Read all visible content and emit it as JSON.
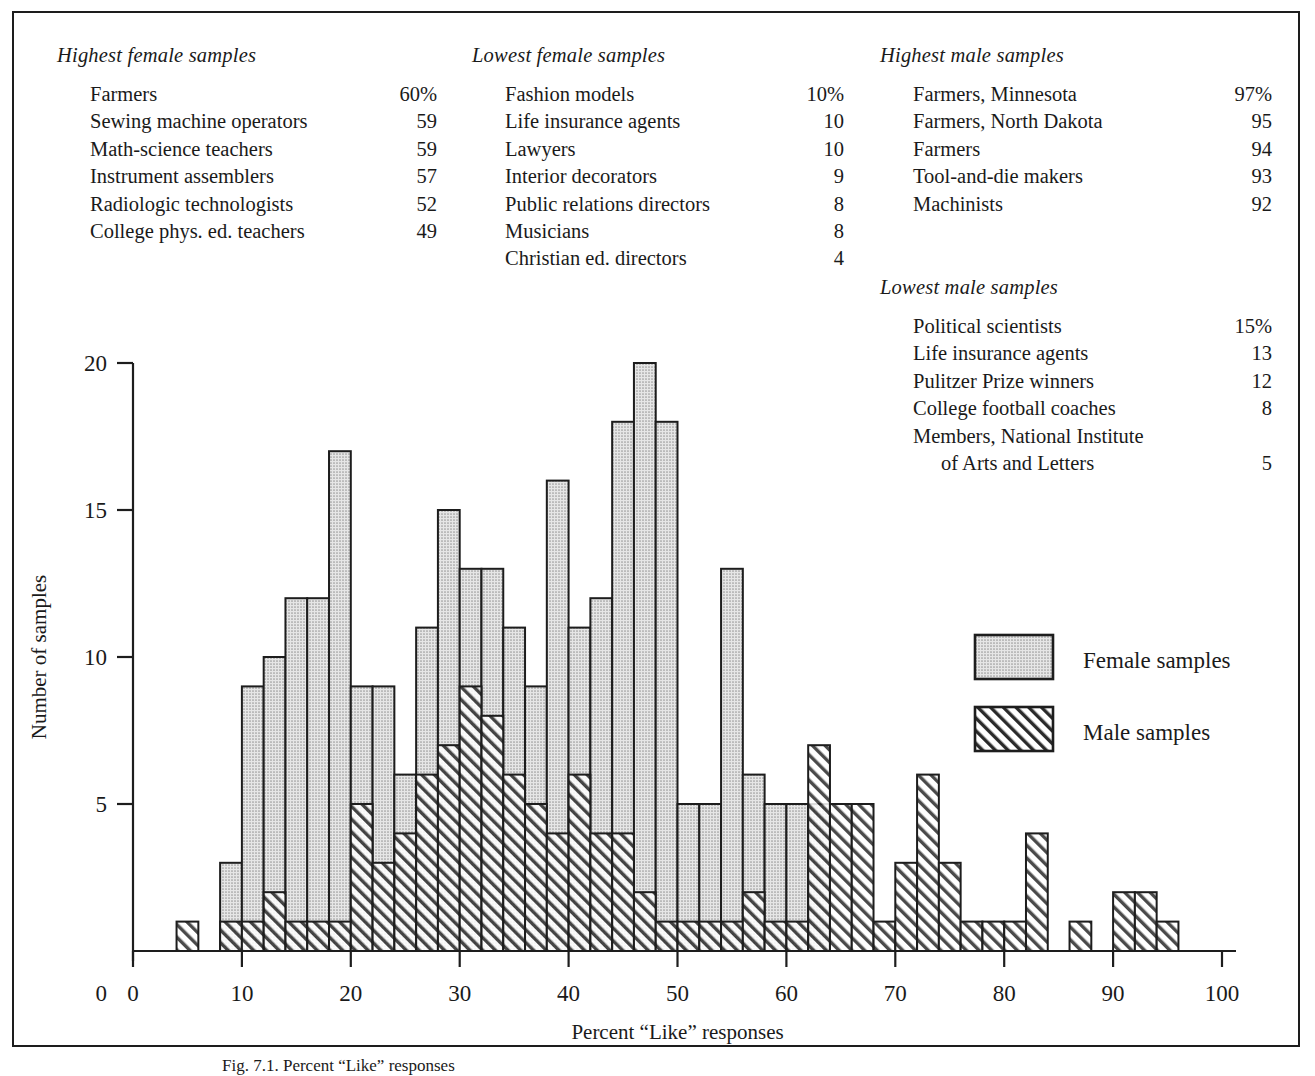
{
  "tables": [
    {
      "id": "highest-female",
      "title": "Highest female samples",
      "rows": [
        {
          "label": "Farmers",
          "value": "60%"
        },
        {
          "label": "Sewing machine operators",
          "value": "59"
        },
        {
          "label": "Math-science teachers",
          "value": "59"
        },
        {
          "label": "Instrument assemblers",
          "value": "57"
        },
        {
          "label": "Radiologic technologists",
          "value": "52"
        },
        {
          "label": "College phys. ed. teachers",
          "value": "49"
        }
      ]
    },
    {
      "id": "lowest-female",
      "title": "Lowest female samples",
      "rows": [
        {
          "label": "Fashion models",
          "value": "10%"
        },
        {
          "label": "Life insurance agents",
          "value": "10"
        },
        {
          "label": "Lawyers",
          "value": "10"
        },
        {
          "label": "Interior decorators",
          "value": "9"
        },
        {
          "label": "Public relations directors",
          "value": "8"
        },
        {
          "label": "Musicians",
          "value": "8"
        },
        {
          "label": "Christian ed. directors",
          "value": "4"
        }
      ]
    },
    {
      "id": "highest-male",
      "title": "Highest male samples",
      "rows": [
        {
          "label": "Farmers, Minnesota",
          "value": "97%"
        },
        {
          "label": "Farmers, North Dakota",
          "value": "95"
        },
        {
          "label": "Farmers",
          "value": "94"
        },
        {
          "label": "Tool-and-die makers",
          "value": "93"
        },
        {
          "label": "Machinists",
          "value": "92"
        }
      ]
    },
    {
      "id": "lowest-male",
      "title": "Lowest male samples",
      "rows": [
        {
          "label": "Political scientists",
          "value": "15%"
        },
        {
          "label": "Life insurance agents",
          "value": "13"
        },
        {
          "label": "Pulitzer Prize winners",
          "value": "12"
        },
        {
          "label": "College football coaches",
          "value": "8"
        },
        {
          "label": "Members, National Institute",
          "value": ""
        },
        {
          "label": "of Arts and Letters",
          "value": "5",
          "continuation": true
        }
      ]
    }
  ],
  "caption": "Fig. 7.1. Percent “Like” responses",
  "colors": {
    "ink": "#1d1d1d",
    "female_fill": "#d6d6d6",
    "male_hatch": "#2a2a2a",
    "paper": "#ffffff"
  },
  "chart_data": {
    "type": "bar",
    "title": "",
    "xlabel": "Percent “Like” responses",
    "ylabel": "Number of samples",
    "xlim": [
      0,
      100
    ],
    "ylim": [
      0,
      20
    ],
    "xticks": [
      0,
      10,
      20,
      30,
      40,
      50,
      60,
      70,
      80,
      90,
      100
    ],
    "yticks": [
      0,
      5,
      10,
      15,
      20
    ],
    "grid": false,
    "bin_width": 2,
    "overlap": "overlaid",
    "legend": {
      "position": "right-inside",
      "entries": [
        "Female samples",
        "Male samples"
      ]
    },
    "bin_starts": [
      4,
      6,
      8,
      10,
      12,
      14,
      16,
      18,
      20,
      22,
      24,
      26,
      28,
      30,
      32,
      34,
      36,
      38,
      40,
      42,
      44,
      46,
      48,
      50,
      52,
      54,
      56,
      58,
      60,
      62,
      64,
      66,
      68,
      70,
      72,
      74,
      76,
      78,
      80,
      82,
      84,
      86,
      88,
      90,
      92,
      94
    ],
    "series": [
      {
        "name": "Female samples",
        "fill": "stipple",
        "values": [
          0,
          0,
          3,
          9,
          10,
          12,
          12,
          17,
          9,
          9,
          6,
          11,
          15,
          13,
          13,
          11,
          9,
          16,
          11,
          12,
          18,
          20,
          18,
          5,
          5,
          13,
          6,
          5,
          5,
          5,
          0,
          0,
          0,
          0,
          0,
          0,
          0,
          0,
          0,
          0,
          0,
          0,
          0,
          0,
          0,
          0
        ]
      },
      {
        "name": "Male samples",
        "fill": "hatch",
        "values": [
          1,
          0,
          1,
          1,
          2,
          1,
          1,
          1,
          5,
          3,
          4,
          6,
          7,
          9,
          8,
          6,
          5,
          4,
          6,
          4,
          4,
          2,
          1,
          1,
          1,
          1,
          2,
          1,
          1,
          7,
          5,
          5,
          1,
          3,
          6,
          3,
          1,
          1,
          1,
          4,
          0,
          1,
          0,
          2,
          2,
          1
        ]
      }
    ]
  }
}
